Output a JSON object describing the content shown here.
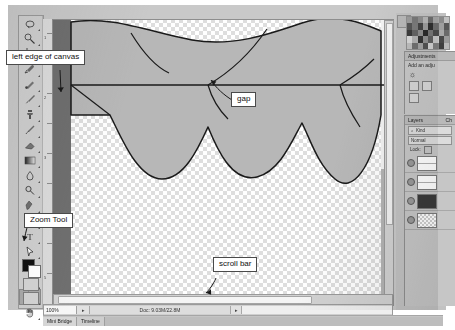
{
  "app": {
    "name": "Adobe Photoshop",
    "document_area_label": "canvas"
  },
  "callouts": [
    {
      "id": "left-edge",
      "text": "left edge of canvas"
    },
    {
      "id": "gap",
      "text": "gap"
    },
    {
      "id": "zoom-tool",
      "text": "Zoom Tool"
    },
    {
      "id": "scroll-bar",
      "text": "scroll bar"
    }
  ],
  "toolbox": {
    "tools": [
      {
        "name": "lasso-tool",
        "icon": "lasso"
      },
      {
        "name": "magic-wand-tool",
        "icon": "wand"
      },
      {
        "name": "crop-tool",
        "icon": "crop"
      },
      {
        "name": "eyedropper-tool",
        "icon": "eyedropper"
      },
      {
        "name": "spot-healing-tool",
        "icon": "healing"
      },
      {
        "name": "brush-tool",
        "icon": "brush"
      },
      {
        "name": "clone-stamp-tool",
        "icon": "stamp"
      },
      {
        "name": "history-brush-tool",
        "icon": "history"
      },
      {
        "name": "eraser-tool",
        "icon": "eraser"
      },
      {
        "name": "gradient-tool",
        "icon": "gradient"
      },
      {
        "name": "blur-tool",
        "icon": "blur"
      },
      {
        "name": "dodge-tool",
        "icon": "dodge"
      },
      {
        "name": "pen-tool",
        "icon": "pen"
      },
      {
        "name": "move-tool",
        "icon": "move"
      },
      {
        "name": "type-tool",
        "icon": "type"
      },
      {
        "name": "path-selection-tool",
        "icon": "arrow"
      },
      {
        "name": "line-tool",
        "icon": "line"
      },
      {
        "name": "ellipse-tool",
        "icon": "ellipse"
      },
      {
        "name": "zoom-tool",
        "icon": "magnifier",
        "selected": true
      },
      {
        "name": "hand-tool",
        "icon": "hand"
      }
    ],
    "foreground_color": "#111111",
    "background_color": "#ffffff"
  },
  "statusbar": {
    "zoom": "100%",
    "doc_info": "Doc: 9.03M/22.8M",
    "left_arrow": "▸",
    "right_arrow": "▸"
  },
  "bottom_tabs": [
    {
      "label": "Mini Bridge"
    },
    {
      "label": "Timeline"
    }
  ],
  "panels": {
    "adjustments": {
      "title": "Adjustments",
      "subtitle": "Add an adju"
    },
    "layers": {
      "title": "Layers",
      "secondary_tab": "Ch",
      "search_placeholder": "Kind",
      "blend_mode": "Normal",
      "lock_label": "Lock:",
      "rows": [
        {
          "name": "layer-row-1",
          "thumb": "wv"
        },
        {
          "name": "layer-row-2",
          "thumb": "wv"
        },
        {
          "name": "layer-row-3",
          "thumb": "dk"
        },
        {
          "name": "layer-row-4",
          "thumb": "ckr"
        }
      ]
    }
  },
  "colors": {
    "shape_fill": "#b7b7b7",
    "shape_stroke": "#1a1a1a",
    "canvas_mat_dark": "#6f6f6f",
    "window_bg": "#c9c9c9",
    "callout_border": "#4a4a4a"
  },
  "artwork": {
    "description": "scalloped curtain shape with straight horizontal guide line and diagonal seam lines over transparent checkerboard canvas"
  }
}
